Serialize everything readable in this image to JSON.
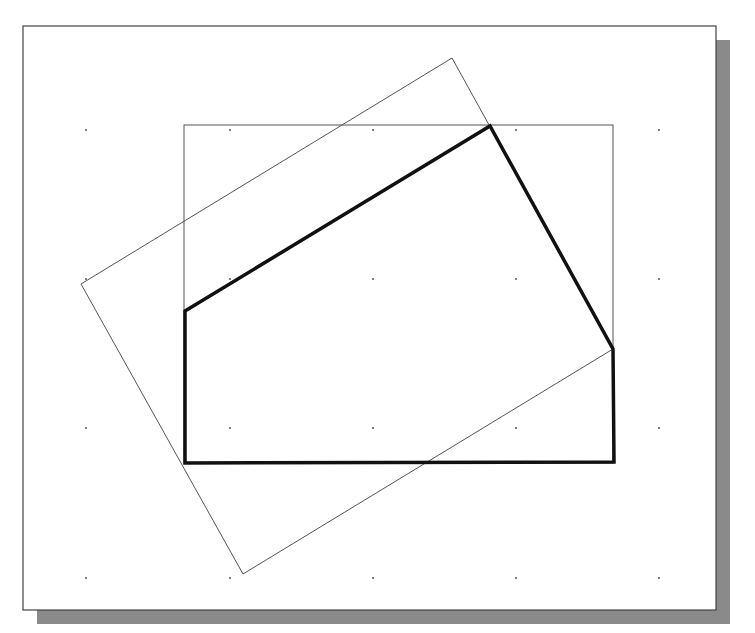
{
  "canvas": {
    "width": 755,
    "height": 633,
    "background": "#ffffff"
  },
  "frame": {
    "x": 23,
    "y": 26,
    "width": 693,
    "height": 584,
    "stroke": "#444444",
    "fill": "#ffffff",
    "stroke_width": 1.2
  },
  "shadow": {
    "offset_x": 14,
    "offset_y": 14,
    "color": "#8a8a8a"
  },
  "grid": {
    "dot_color": "#555555",
    "dot_radius": 1,
    "xs": [
      86,
      230,
      373,
      516,
      659
    ],
    "ys": [
      130,
      279,
      428,
      578
    ]
  },
  "shapes": {
    "reference_rect": {
      "x": 184,
      "y": 125,
      "width": 429,
      "height": 338,
      "stroke": "#555555",
      "stroke_width": 1
    },
    "rotated_rect": {
      "points": [
        [
          452,
          58
        ],
        [
          613,
          349
        ],
        [
          243,
          574
        ],
        [
          81,
          284
        ]
      ],
      "stroke": "#555555",
      "stroke_width": 1
    },
    "profile_polygon": {
      "points": [
        [
          185,
          311
        ],
        [
          490,
          126
        ],
        [
          613,
          349
        ],
        [
          614,
          462
        ],
        [
          185,
          463
        ]
      ],
      "stroke": "#111111",
      "stroke_width": 3.5
    }
  }
}
